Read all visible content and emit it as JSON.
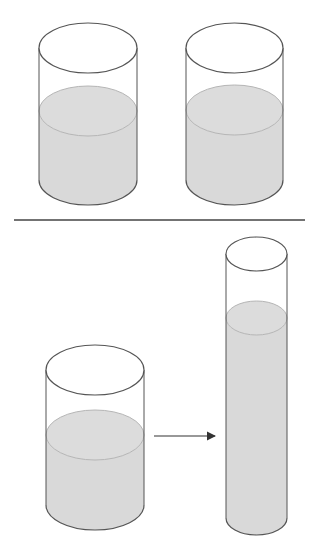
{
  "diagram": {
    "colors": {
      "outline": "#555555",
      "liquid": "#d9d9d9",
      "liquid_surface_edge": "#b5b5b5",
      "background": "#ffffff",
      "divider": "#444444",
      "arrow": "#333333"
    },
    "top_section": {
      "containers": [
        {
          "id": "cylinder-a",
          "shape": "wide",
          "liquid_level": "equal"
        },
        {
          "id": "cylinder-b",
          "shape": "wide",
          "liquid_level": "equal"
        }
      ]
    },
    "bottom_section": {
      "containers": [
        {
          "id": "cylinder-wide",
          "shape": "wide",
          "liquid_level": "medium"
        },
        {
          "id": "cylinder-tall",
          "shape": "tall-narrow",
          "liquid_level": "high"
        }
      ],
      "arrow": {
        "direction": "right",
        "from": "cylinder-wide",
        "to": "cylinder-tall"
      }
    }
  }
}
